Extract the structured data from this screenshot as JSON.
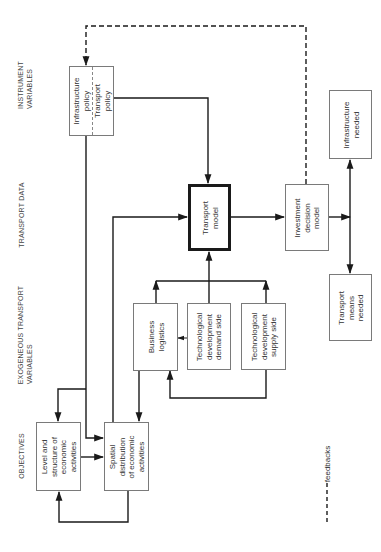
{
  "diagram": {
    "row_labels": {
      "instrument": "INSTRUMENT\nVARIABLES",
      "transport_data": "TRANSPORT DATA",
      "exogeneous": "EXOGENEOUS TRANSPORT\nVARIABLES",
      "objectives": "OBJECTIVES"
    },
    "nodes": {
      "infrastructure_policy": "Infrastructure\npolicy",
      "transport_policy": "Transport\npolicy",
      "transport_model": "Transport\nmodel",
      "investment_decision_model": "Investment\ndecision\nmodel",
      "infrastructure_needed": "Infrastructure\nneeded",
      "transport_means_needed": "Transport\nmeans\nneeded",
      "business_logistics": "Business\nlogistics",
      "tech_demand": "Technological\ndevelopment\ndemand side",
      "tech_supply": "Technological\ndevelopment\nsupply side",
      "level_structure": "Level and\nstructure of\neconomic\nactivities",
      "spatial_distribution": "Spatial\ndistribution\nof economic\nactivities"
    },
    "legend": {
      "feedbacks": "feedbacks"
    },
    "edges": [
      {
        "from": "transport_policy",
        "to": "transport_model",
        "style": "solid"
      },
      {
        "from": "infrastructure_policy",
        "to": "spatial_distribution",
        "style": "solid"
      },
      {
        "from": "infrastructure_policy",
        "to": "level_structure",
        "style": "solid"
      },
      {
        "from": "level_structure",
        "to": "spatial_distribution",
        "style": "solid"
      },
      {
        "from": "spatial_distribution",
        "to": "level_structure",
        "style": "solid"
      },
      {
        "from": "spatial_distribution",
        "to": "transport_model",
        "style": "solid"
      },
      {
        "from": "business_logistics",
        "to": "spatial_distribution",
        "style": "solid"
      },
      {
        "from": "business_logistics",
        "to": "transport_model",
        "style": "solid"
      },
      {
        "from": "tech_demand",
        "to": "transport_model",
        "style": "solid"
      },
      {
        "from": "tech_supply",
        "to": "transport_model",
        "style": "solid"
      },
      {
        "from": "tech_demand",
        "to": "business_logistics",
        "style": "solid"
      },
      {
        "from": "tech_supply",
        "to": "business_logistics",
        "style": "solid"
      },
      {
        "from": "transport_model",
        "to": "investment_decision_model",
        "style": "solid"
      },
      {
        "from": "investment_decision_model",
        "to": "infrastructure_needed",
        "style": "solid"
      },
      {
        "from": "investment_decision_model",
        "to": "transport_means_needed",
        "style": "solid"
      },
      {
        "from": "investment_decision_model",
        "to": "infrastructure_policy",
        "style": "dashed"
      }
    ]
  }
}
